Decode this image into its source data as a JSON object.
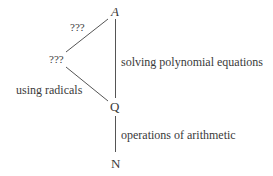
{
  "diagram": {
    "nodes": {
      "top": "A",
      "middle_left": "???",
      "middle": "Q",
      "bottom": "N"
    },
    "edge_labels": {
      "top_left": "???",
      "left_lower": "using radicals",
      "top_to_middle": "solving polynomial equations",
      "middle_to_bottom": "operations of arithmetic"
    },
    "line_color": "#555555"
  }
}
